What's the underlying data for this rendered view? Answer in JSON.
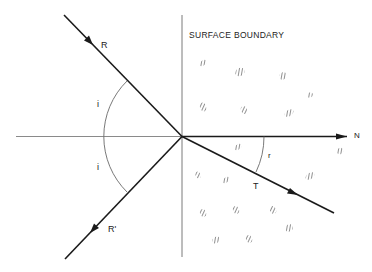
{
  "diagram": {
    "type": "ray-refraction-reflection",
    "boundary_label": "SURFACE BOUNDARY",
    "labels": {
      "incident_ray": "R",
      "reflected_ray": "R'",
      "transmitted_ray": "T",
      "normal": "N",
      "angle_incidence_upper": "i",
      "angle_incidence_lower": "i",
      "angle_refraction": "r"
    },
    "colors": {
      "ray": "#1a1a1a",
      "axis": "#7a7a7a",
      "arc": "#6a6a6a",
      "hatch": "#555555",
      "background": "#ffffff"
    }
  }
}
